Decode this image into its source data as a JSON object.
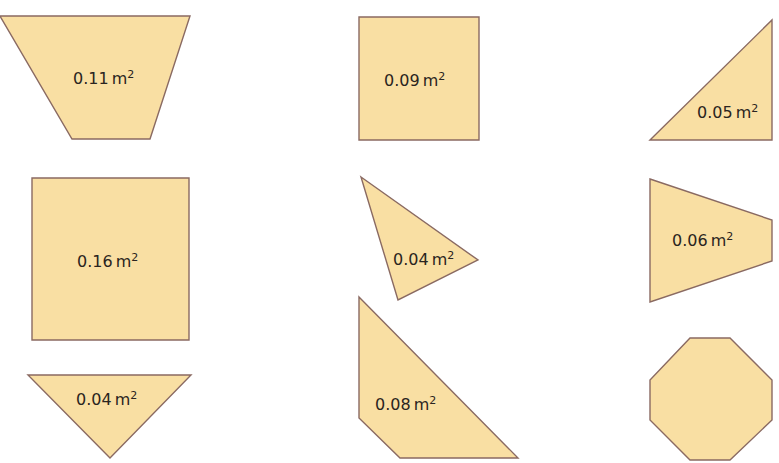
{
  "shapes": [
    {
      "id": "trapezoid-inverted",
      "type": "trapezoid",
      "area_value": "0.11",
      "unit": "m",
      "exponent": "2",
      "points": "0,16 190,16 150,139 72,139",
      "label_x": 73,
      "label_y": 84
    },
    {
      "id": "square-small",
      "type": "square",
      "area_value": "0.09",
      "unit": "m",
      "exponent": "2",
      "points": "359,17 479,17 479,140 359,140",
      "label_x": 384,
      "label_y": 86
    },
    {
      "id": "right-triangle",
      "type": "right-triangle",
      "area_value": "0.05",
      "unit": "m",
      "exponent": "2",
      "points": "650,140 772,20 772,140",
      "label_x": 697,
      "label_y": 118
    },
    {
      "id": "square-large",
      "type": "square",
      "area_value": "0.16",
      "unit": "m",
      "exponent": "2",
      "points": "32,178 189,178 189,340 32,340",
      "label_x": 77,
      "label_y": 267
    },
    {
      "id": "scalene-triangle",
      "type": "triangle",
      "area_value": "0.04",
      "unit": "m",
      "exponent": "2",
      "points": "361,177 478,260 398,300",
      "label_x": 393,
      "label_y": 265
    },
    {
      "id": "trapezoid-sideways",
      "type": "trapezoid",
      "area_value": "0.06",
      "unit": "m",
      "exponent": "2",
      "points": "650,179 772,220 772,261 650,302",
      "label_x": 672,
      "label_y": 246
    },
    {
      "id": "triangle-down",
      "type": "triangle",
      "area_value": "0.04",
      "unit": "m",
      "exponent": "2",
      "points": "28,375 191,375 110,458",
      "label_x": 76,
      "label_y": 405
    },
    {
      "id": "quadrilateral",
      "type": "quadrilateral",
      "area_value": "0.08",
      "unit": "m",
      "exponent": "2",
      "points": "359,297 518,458 400,458 359,418",
      "label_x": 375,
      "label_y": 410
    },
    {
      "id": "octagon",
      "type": "octagon",
      "area_value": "",
      "unit": "",
      "exponent": "",
      "points": "690,338 730,338 772,380 772,420 730,460 690,460 650,420 650,380",
      "label_x": 0,
      "label_y": 0
    }
  ],
  "colors": {
    "fill": "#f9dfa3",
    "stroke": "#8a6a62",
    "text": "#2a2420"
  }
}
